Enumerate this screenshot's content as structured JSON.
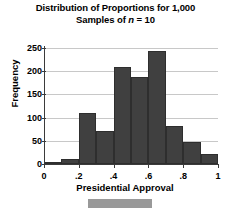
{
  "chart_data": {
    "type": "bar",
    "title": "Distribution of Proportions for 1,000 Samples of n = 10",
    "title_line_1": "Distribution of Proportions for 1,000",
    "title_line_2_prefix": "Samples of ",
    "title_line_2_italic": "n",
    "title_line_2_suffix": " = 10",
    "xlabel": "Presidential Approval",
    "ylabel": "Frequency",
    "xlim": [
      0,
      1
    ],
    "ylim": [
      0,
      250
    ],
    "grid": "horizontal",
    "legend": "none",
    "bin_width": 0.1,
    "bin_edges": [
      0,
      0.1,
      0.2,
      0.3,
      0.4,
      0.5,
      0.6,
      0.7,
      0.8,
      0.9,
      1.0
    ],
    "categories": [
      "0–.1",
      ".1–.2",
      ".2–.3",
      ".3–.4",
      ".4–.5",
      ".5–.6",
      ".6–.7",
      ".7–.8",
      ".8–.9",
      ".9–1"
    ],
    "values": [
      0,
      11,
      109,
      72,
      209,
      188,
      243,
      82,
      47,
      22
    ],
    "bar_color": "#404040",
    "grid_color": "#c8c8c8",
    "axis_color": "#3b3b3b",
    "yticks": [
      {
        "value": 0,
        "label": "0"
      },
      {
        "value": 50,
        "label": "50"
      },
      {
        "value": 100,
        "label": "100"
      },
      {
        "value": 150,
        "label": "150"
      },
      {
        "value": 200,
        "label": "200"
      },
      {
        "value": 250,
        "label": "250"
      }
    ],
    "xticks": [
      {
        "value": 0,
        "label": "0"
      },
      {
        "value": 0.2,
        "label": ".2"
      },
      {
        "value": 0.4,
        "label": ".4"
      },
      {
        "value": 0.6,
        "label": ".6"
      },
      {
        "value": 0.8,
        "label": ".8"
      },
      {
        "value": 1,
        "label": "1"
      }
    ]
  },
  "caption": {
    "text": ""
  }
}
